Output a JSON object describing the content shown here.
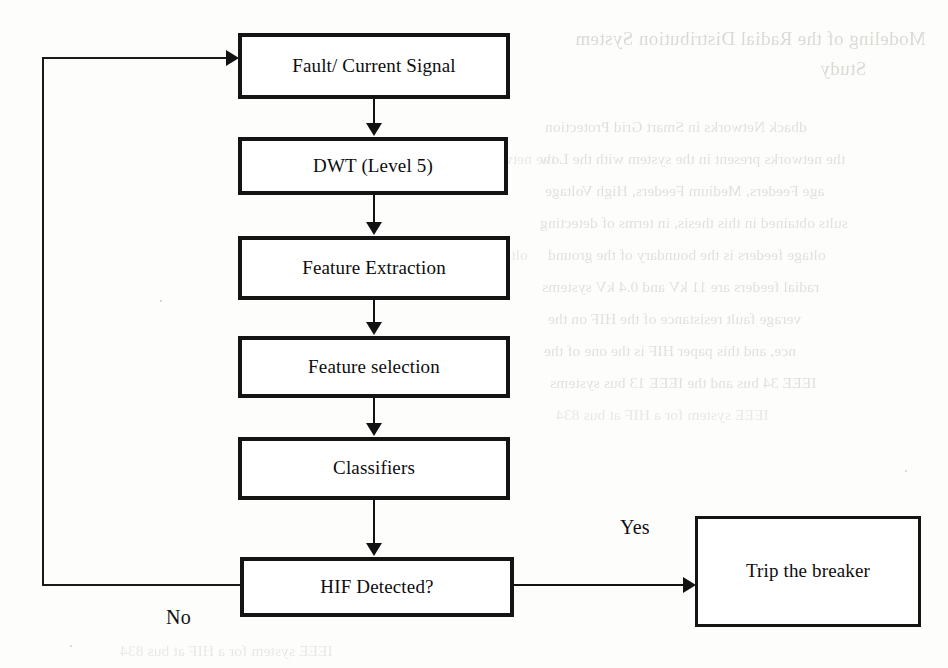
{
  "page": {
    "width": 948,
    "height": 668,
    "background_color": "#fdfdfc",
    "ink_color": "#121212"
  },
  "diagram": {
    "type": "flowchart",
    "orientation": "top-to-bottom with feedback loop",
    "nodes": [
      {
        "id": "fault_signal",
        "label": "Fault/ Current Signal",
        "shape": "rectangle",
        "x": 238,
        "y": 33,
        "w": 272,
        "h": 66
      },
      {
        "id": "dwt",
        "label": "DWT (Level 5)",
        "shape": "rectangle",
        "x": 238,
        "y": 137,
        "w": 270,
        "h": 58
      },
      {
        "id": "feature_extract",
        "label": "Feature Extraction",
        "shape": "rectangle",
        "x": 238,
        "y": 236,
        "w": 272,
        "h": 64
      },
      {
        "id": "feature_select",
        "label": "Feature selection",
        "shape": "rectangle",
        "x": 238,
        "y": 336,
        "w": 272,
        "h": 62
      },
      {
        "id": "classifiers",
        "label": "Classifiers",
        "shape": "rectangle",
        "x": 238,
        "y": 437,
        "w": 272,
        "h": 63
      },
      {
        "id": "hif_detected",
        "label": "HIF Detected?",
        "shape": "rectangle",
        "x": 240,
        "y": 557,
        "w": 274,
        "h": 60
      },
      {
        "id": "trip_breaker",
        "label": "Trip the breaker",
        "shape": "rectangle",
        "x": 695,
        "y": 516,
        "w": 226,
        "h": 111
      }
    ],
    "edges": [
      {
        "from": "fault_signal",
        "to": "dwt",
        "label": "",
        "direction": "down"
      },
      {
        "from": "dwt",
        "to": "feature_extract",
        "label": "",
        "direction": "down"
      },
      {
        "from": "feature_extract",
        "to": "feature_select",
        "label": "",
        "direction": "down"
      },
      {
        "from": "feature_select",
        "to": "classifiers",
        "label": "",
        "direction": "down"
      },
      {
        "from": "classifiers",
        "to": "hif_detected",
        "label": "",
        "direction": "down"
      },
      {
        "from": "hif_detected",
        "to": "trip_breaker",
        "label": "Yes",
        "direction": "right"
      },
      {
        "from": "hif_detected",
        "to": "fault_signal",
        "label": "No",
        "direction": "left-up-feedback"
      }
    ],
    "edge_labels": {
      "yes": "Yes",
      "no": "No"
    }
  },
  "background_showthrough": {
    "description": "mirror-reversed ink bleeding through from the reverse side of the printed page",
    "lines": [
      "Modeling of the Radial Distribution System",
      "Study",
      "dback Networks in Smart Grid Protection",
      "the networks present in the system with the Low",
      "age Feeders, Medium Feeders, High Voltage",
      "sults obtained in this thesis, in terms of detecting",
      "oltage feeders is the boundary of the ground",
      "radial feeders are 11 kV and 0.4 kV systems",
      "verage fault resistance of the HIF on the",
      "nce, and this paper HIF is the one of the",
      "IEEE 34 bus and the IEEE 13 bus systems",
      "IEEE system for a HIF at bus 834"
    ]
  }
}
